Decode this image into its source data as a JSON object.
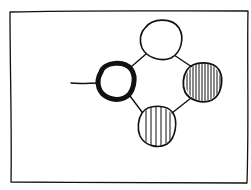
{
  "diagram": {
    "style": "hand-drawn sketch",
    "stroke_color": "#111111",
    "background": "#ffffff",
    "frame": {
      "x": 10,
      "y": 11,
      "w": 237,
      "h": 172
    },
    "nodes": [
      {
        "id": "start",
        "label": "",
        "fill": "none",
        "emphasis": "bold-outline",
        "cx": 116,
        "cy": 81,
        "rx": 17,
        "ry": 17
      },
      {
        "id": "top",
        "label": "",
        "fill": "none",
        "emphasis": "normal",
        "cx": 161,
        "cy": 39,
        "rx": 20,
        "ry": 21
      },
      {
        "id": "right",
        "label": "",
        "fill": "dense-vertical-stripes",
        "emphasis": "normal",
        "cx": 203,
        "cy": 82,
        "rx": 19,
        "ry": 20
      },
      {
        "id": "bottom",
        "label": "",
        "fill": "sparse-vertical-stripes",
        "emphasis": "normal",
        "cx": 157,
        "cy": 126,
        "rx": 19,
        "ry": 21
      }
    ],
    "edges": [
      {
        "from": "start",
        "to": "top"
      },
      {
        "from": "top",
        "to": "right"
      },
      {
        "from": "right",
        "to": "bottom"
      },
      {
        "from": "bottom",
        "to": "start"
      }
    ],
    "entry_line": {
      "x1": 71,
      "y1": 83,
      "x2": 99,
      "y2": 83
    }
  }
}
